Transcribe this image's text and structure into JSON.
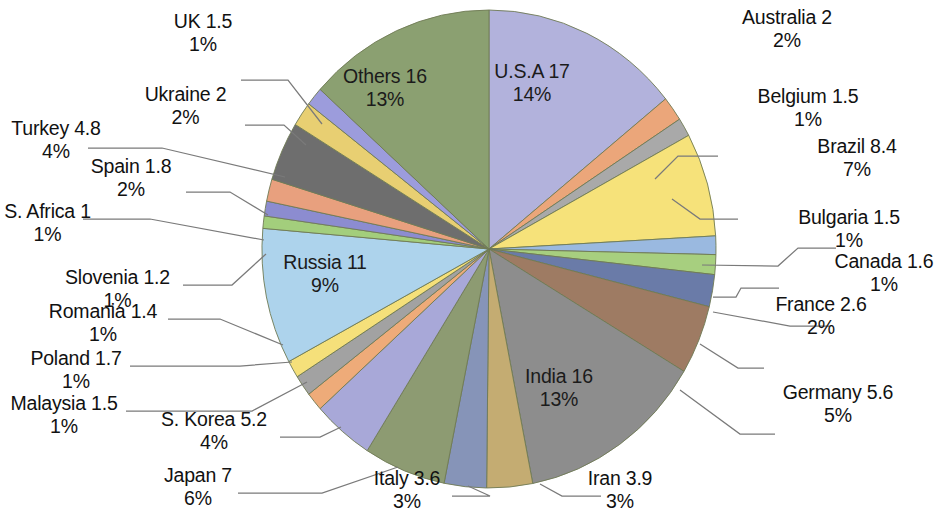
{
  "chart_data": {
    "type": "pie",
    "title": "",
    "start_angle_deg": 0,
    "direction": "clockwise",
    "total": 123.1,
    "legend": "none",
    "labels_show": [
      "name",
      "value",
      "percent"
    ],
    "categories": [
      "U.S.A",
      "Australia",
      "Belgium",
      "Brazil",
      "Bulgaria",
      "Canada",
      "France",
      "Germany",
      "India",
      "Iran",
      "Italy",
      "Japan",
      "S. Korea",
      "Malaysia",
      "Poland",
      "Romania",
      "Russia",
      "S. Africa",
      "Slovenia",
      "Spain",
      "Turkey",
      "Ukraine",
      "UK",
      "Others"
    ],
    "values": [
      17,
      2,
      1.5,
      8.4,
      1.5,
      1.6,
      2.6,
      5.6,
      16,
      3.9,
      3.6,
      7,
      5.2,
      1.5,
      1.7,
      1.4,
      11,
      1,
      1.2,
      1.8,
      4.8,
      2,
      1.5,
      16
    ],
    "percents": [
      "14%",
      "2%",
      "1%",
      "7%",
      "1%",
      "1%",
      "2%",
      "5%",
      "13%",
      "3%",
      "3%",
      "6%",
      "4%",
      "1%",
      "1%",
      "1%",
      "9%",
      "1%",
      "1%",
      "2%",
      "4%",
      "2%",
      "1%",
      "13%"
    ],
    "colors": [
      "#b2b2dc",
      "#eba67a",
      "#a9a9a9",
      "#f6e27a",
      "#9ab9e0",
      "#a7cf7f",
      "#6a7ba8",
      "#9e7b63",
      "#8d8d8d",
      "#c4ac72",
      "#8694b8",
      "#8d9b72",
      "#a8a8d8",
      "#eeab79",
      "#a2a2a2",
      "#f5e07a",
      "#add3ec",
      "#a3ce7c",
      "#8c8cd0",
      "#e8a07e",
      "#6e6e6e",
      "#e8cf72",
      "#9c9cdc",
      "#8ba071"
    ],
    "slices": [
      {
        "name": "U.S.A",
        "value": 17,
        "percent": "14%",
        "color": "#b2b2dc",
        "label_line1": "U.S.A 17",
        "label_line2": "14%",
        "label_position": "inside"
      },
      {
        "name": "Australia",
        "value": 2,
        "percent": "2%",
        "color": "#eba67a",
        "label_line1": "Australia 2",
        "label_line2": "2%",
        "label_position": "outside"
      },
      {
        "name": "Belgium",
        "value": 1.5,
        "percent": "1%",
        "color": "#a9a9a9",
        "label_line1": "Belgium 1.5",
        "label_line2": "1%",
        "label_position": "outside"
      },
      {
        "name": "Brazil",
        "value": 8.4,
        "percent": "7%",
        "color": "#f6e27a",
        "label_line1": "Brazil 8.4",
        "label_line2": "7%",
        "label_position": "outside"
      },
      {
        "name": "Bulgaria",
        "value": 1.5,
        "percent": "1%",
        "color": "#9ab9e0",
        "label_line1": "Bulgaria 1.5",
        "label_line2": "1%",
        "label_position": "outside"
      },
      {
        "name": "Canada",
        "value": 1.6,
        "percent": "1%",
        "color": "#a7cf7f",
        "label_line1": "Canada 1.6",
        "label_line2": "1%",
        "label_position": "outside"
      },
      {
        "name": "France",
        "value": 2.6,
        "percent": "2%",
        "color": "#6a7ba8",
        "label_line1": "France 2.6",
        "label_line2": "2%",
        "label_position": "outside"
      },
      {
        "name": "Germany",
        "value": 5.6,
        "percent": "5%",
        "color": "#9e7b63",
        "label_line1": "Germany 5.6",
        "label_line2": "5%",
        "label_position": "outside"
      },
      {
        "name": "India",
        "value": 16,
        "percent": "13%",
        "color": "#8d8d8d",
        "label_line1": "India 16",
        "label_line2": "13%",
        "label_position": "inside"
      },
      {
        "name": "Iran",
        "value": 3.9,
        "percent": "3%",
        "color": "#c4ac72",
        "label_line1": "Iran 3.9",
        "label_line2": "3%",
        "label_position": "outside"
      },
      {
        "name": "Italy",
        "value": 3.6,
        "percent": "3%",
        "color": "#8694b8",
        "label_line1": "Italy 3.6",
        "label_line2": "3%",
        "label_position": "outside"
      },
      {
        "name": "Japan",
        "value": 7,
        "percent": "6%",
        "color": "#8d9b72",
        "label_line1": "Japan 7",
        "label_line2": "6%",
        "label_position": "outside"
      },
      {
        "name": "S. Korea",
        "value": 5.2,
        "percent": "4%",
        "color": "#a8a8d8",
        "label_line1": "S. Korea 5.2",
        "label_line2": "4%",
        "label_position": "outside"
      },
      {
        "name": "Malaysia",
        "value": 1.5,
        "percent": "1%",
        "color": "#eeab79",
        "label_line1": "Malaysia 1.5",
        "label_line2": "1%",
        "label_position": "outside"
      },
      {
        "name": "Poland",
        "value": 1.7,
        "percent": "1%",
        "color": "#a2a2a2",
        "label_line1": "Poland 1.7",
        "label_line2": "1%",
        "label_position": "outside"
      },
      {
        "name": "Romania",
        "value": 1.4,
        "percent": "1%",
        "color": "#f5e07a",
        "label_line1": "Romania 1.4",
        "label_line2": "1%",
        "label_position": "outside"
      },
      {
        "name": "Russia",
        "value": 11,
        "percent": "9%",
        "color": "#add3ec",
        "label_line1": "Russia 11",
        "label_line2": "9%",
        "label_position": "inside"
      },
      {
        "name": "S. Africa",
        "value": 1,
        "percent": "1%",
        "color": "#a3ce7c",
        "label_line1": "S. Africa 1",
        "label_line2": "1%",
        "label_position": "outside"
      },
      {
        "name": "Slovenia",
        "value": 1.2,
        "percent": "1%",
        "color": "#8c8cd0",
        "label_line1": "Slovenia 1.2",
        "label_line2": "1%",
        "label_position": "outside"
      },
      {
        "name": "Spain",
        "value": 1.8,
        "percent": "2%",
        "color": "#e8a07e",
        "label_line1": "Spain 1.8",
        "label_line2": "2%",
        "label_position": "outside"
      },
      {
        "name": "Turkey",
        "value": 4.8,
        "percent": "4%",
        "color": "#6e6e6e",
        "label_line1": "Turkey 4.8",
        "label_line2": "4%",
        "label_position": "outside"
      },
      {
        "name": "Ukraine",
        "value": 2,
        "percent": "2%",
        "color": "#e8cf72",
        "label_line1": "Ukraine 2",
        "label_line2": "2%",
        "label_position": "outside"
      },
      {
        "name": "UK",
        "value": 1.5,
        "percent": "1%",
        "color": "#9c9cdc",
        "label_line1": "UK 1.5",
        "label_line2": "1%",
        "label_position": "outside"
      },
      {
        "name": "Others",
        "value": 16,
        "percent": "13%",
        "color": "#8ba071",
        "label_line1": "Others 16",
        "label_line2": "13%",
        "label_position": "inside"
      }
    ]
  },
  "labels": {
    "usa": {
      "l1": "U.S.A 17",
      "l2": "14%"
    },
    "others": {
      "l1": "Others 16",
      "l2": "13%"
    },
    "russia": {
      "l1": "Russia 11",
      "l2": "9%"
    },
    "india": {
      "l1": "India 16",
      "l2": "13%"
    },
    "australia": {
      "l1": "Australia 2",
      "l2": "2%"
    },
    "belgium": {
      "l1": "Belgium 1.5",
      "l2": "1%"
    },
    "brazil": {
      "l1": "Brazil 8.4",
      "l2": "7%"
    },
    "bulgaria": {
      "l1": "Bulgaria 1.5",
      "l2": "1%"
    },
    "canada": {
      "l1": "Canada 1.6",
      "l2": "1%"
    },
    "france": {
      "l1": "France 2.6",
      "l2": "2%"
    },
    "germany": {
      "l1": "Germany 5.6",
      "l2": "5%"
    },
    "iran": {
      "l1": "Iran 3.9",
      "l2": "3%"
    },
    "italy": {
      "l1": "Italy 3.6",
      "l2": "3%"
    },
    "japan": {
      "l1": "Japan 7",
      "l2": "6%"
    },
    "skorea": {
      "l1": "S. Korea 5.2",
      "l2": "4%"
    },
    "malaysia": {
      "l1": "Malaysia 1.5",
      "l2": "1%"
    },
    "poland": {
      "l1": "Poland 1.7",
      "l2": "1%"
    },
    "romania": {
      "l1": "Romania 1.4",
      "l2": "1%"
    },
    "slovenia": {
      "l1": "Slovenia 1.2",
      "l2": "1%"
    },
    "safrica": {
      "l1": "S. Africa 1",
      "l2": "1%"
    },
    "spain": {
      "l1": "Spain 1.8",
      "l2": "2%"
    },
    "turkey": {
      "l1": "Turkey 4.8",
      "l2": "4%"
    },
    "ukraine": {
      "l1": "Ukraine 2",
      "l2": "2%"
    },
    "uk": {
      "l1": "UK 1.5",
      "l2": "1%"
    }
  }
}
